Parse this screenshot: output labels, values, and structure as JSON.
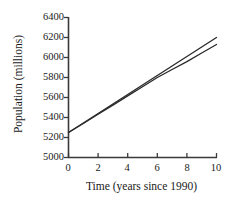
{
  "chart_data": {
    "type": "line",
    "title": "",
    "xlabel": "Time (years since 1990)",
    "ylabel": "Population (millions)",
    "xlim": [
      0,
      10
    ],
    "ylim": [
      5000,
      6400
    ],
    "xticks": [
      0,
      2,
      4,
      6,
      8,
      10
    ],
    "yticks": [
      5000,
      5200,
      5400,
      5600,
      5800,
      6000,
      6200,
      6400
    ],
    "xtick_labels": [
      "0",
      "2",
      "4",
      "6",
      "8",
      "10"
    ],
    "ytick_labels": [
      "5000",
      "5200",
      "5400",
      "5600",
      "5800",
      "6000",
      "6200",
      "6400"
    ],
    "grid": false,
    "legend": "none",
    "line_color": "#2b2b2b",
    "axis_color": "#3a3a3a",
    "background": "#ffffff",
    "series": [
      {
        "name": "Line 1 (steeper)",
        "x": [
          0,
          1,
          2,
          3,
          4,
          5,
          6,
          7,
          8,
          9,
          10
        ],
        "values": [
          5250,
          5345,
          5440,
          5535,
          5630,
          5725,
          5820,
          5915,
          6010,
          6105,
          6200
        ]
      },
      {
        "name": "Line 2 (shallower)",
        "x": [
          0,
          1,
          2,
          3,
          4,
          5,
          6,
          7,
          8,
          9,
          10
        ],
        "values": [
          5250,
          5340,
          5432,
          5524,
          5616,
          5708,
          5800,
          5880,
          5958,
          6045,
          6130
        ]
      }
    ],
    "annotations": [
      "Two nearly collinear lines originating at approximately 5250 at t=0",
      "Lines cross near t = 5-6 around 5720-5820",
      "Upper line ends at 6200, lower line ends at 6130 at t = 10"
    ]
  }
}
